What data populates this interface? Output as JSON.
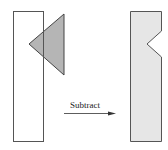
{
  "diagram": {
    "operation_label": "Subtract",
    "colors": {
      "outline": "#555555",
      "triangle_fill": "#a8a8a8",
      "result_fill": "#e6e6e6",
      "background": "#ffffff"
    },
    "shapes": {
      "rectangle": {
        "x": 13,
        "y": 11,
        "width": 30,
        "height": 130
      },
      "triangle": {
        "points": [
          [
            29,
            44
          ],
          [
            64,
            14
          ],
          [
            64,
            75
          ]
        ]
      },
      "result": {
        "points": [
          [
            130,
            11
          ],
          [
            161,
            11
          ],
          [
            161,
            31
          ],
          [
            147,
            44
          ],
          [
            161,
            57
          ],
          [
            161,
            141
          ],
          [
            130,
            141
          ]
        ]
      }
    },
    "arrow": {
      "x1": 64,
      "y1": 113,
      "x2": 116,
      "y2": 113
    }
  }
}
